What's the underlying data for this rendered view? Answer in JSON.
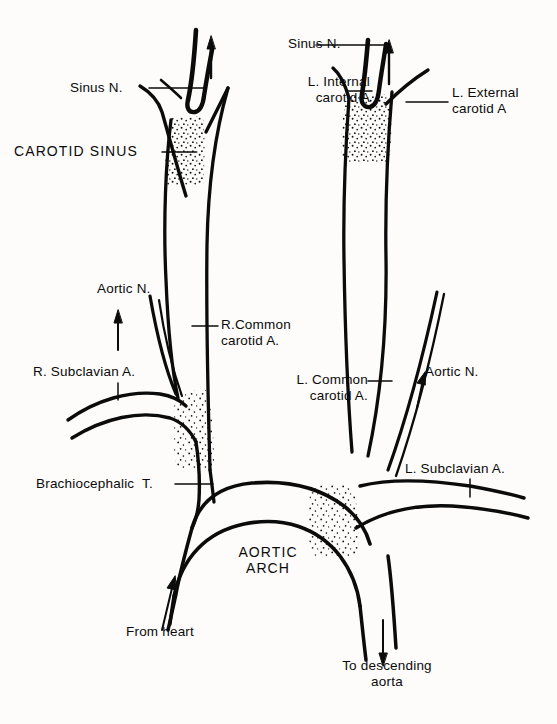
{
  "figure": {
    "ink_color": "#0b0b0b",
    "background_color": "#fdfcfa",
    "stipple_color": "#111111"
  },
  "labels": {
    "sinus_n_right": "Sinus N.",
    "carotid_sinus": "CAROTID SINUS",
    "sinus_n_left": "Sinus N.",
    "l_internal_carotid": "L. Internal\ncarotid A",
    "l_external_carotid": "L. External\ncarotid A",
    "aortic_n_left_side": "Aortic N.",
    "r_common_carotid": "R.Common\ncarotid A.",
    "r_subclavian": "R. Subclavian A.",
    "l_common_carotid": "L. Common\ncarotid A.",
    "aortic_n_right_side": "Aortic N.",
    "brachiocephalic": "Brachiocephalic  T.",
    "l_subclavian": "L. Subclavian A.",
    "aortic_arch": "AORTIC\nARCH",
    "from_heart": "From heart",
    "to_descending_aorta": "To descending\naorta"
  },
  "structures": [
    {
      "name": "right-common-carotid-artery",
      "label": "R.Common carotid A."
    },
    {
      "name": "right-carotid-sinus",
      "label": "CAROTID SINUS"
    },
    {
      "name": "right-sinus-nerve",
      "label": "Sinus N."
    },
    {
      "name": "left-common-carotid-artery",
      "label": "L. Common carotid A."
    },
    {
      "name": "left-internal-carotid-artery",
      "label": "L. Internal carotid A"
    },
    {
      "name": "left-external-carotid-artery",
      "label": "L. External carotid A"
    },
    {
      "name": "left-sinus-nerve",
      "label": "Sinus N."
    },
    {
      "name": "right-subclavian-artery",
      "label": "R. Subclavian A."
    },
    {
      "name": "left-subclavian-artery",
      "label": "L. Subclavian A."
    },
    {
      "name": "brachiocephalic-trunk",
      "label": "Brachiocephalic  T."
    },
    {
      "name": "aortic-arch",
      "label": "AORTIC ARCH"
    },
    {
      "name": "left-aortic-nerve",
      "label": "Aortic N."
    },
    {
      "name": "right-aortic-nerve",
      "label": "Aortic N."
    },
    {
      "name": "ascending-aorta-inflow",
      "label": "From heart"
    },
    {
      "name": "descending-aorta-outflow",
      "label": "To descending aorta"
    }
  ]
}
